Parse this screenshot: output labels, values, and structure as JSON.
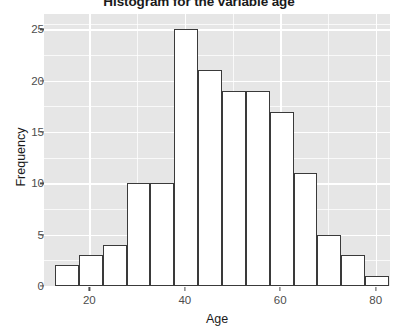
{
  "chart_data": {
    "type": "bar",
    "title": "Histogram for the variable age",
    "xlabel": "Age",
    "ylabel": "Frequency",
    "bin_width": 5,
    "bin_start": 12.8,
    "categories": [
      "12.8-17.8",
      "17.8-22.8",
      "22.8-27.8",
      "27.8-32.8",
      "32.8-37.8",
      "37.8-42.8",
      "42.8-47.8",
      "47.8-52.8",
      "52.8-57.8",
      "57.8-62.8",
      "62.8-67.8",
      "67.8-72.8",
      "72.8-77.8",
      "77.8-82.8"
    ],
    "values": [
      2,
      3,
      4,
      10,
      10,
      25,
      21,
      19,
      19,
      17,
      11,
      5,
      3,
      1
    ],
    "x": [
      12.8,
      17.8,
      22.8,
      27.8,
      32.8,
      37.8,
      42.8,
      47.8,
      52.8,
      57.8,
      62.8,
      67.8,
      72.8,
      77.8
    ],
    "xlim": [
      10.5,
      83
    ],
    "ylim": [
      0,
      26.5
    ],
    "y_ticks": [
      0,
      5,
      10,
      15,
      20,
      25
    ],
    "y_minor_ticks": [
      2.5,
      7.5,
      12.5,
      17.5,
      22.5,
      25.5
    ],
    "x_ticks": [
      20,
      40,
      60,
      80
    ],
    "x_minor_ticks": [
      10,
      30,
      50,
      70
    ],
    "grid": true,
    "legend": "none",
    "panel_color": "#e6e6e6",
    "grid_color": "#ffffff",
    "bar_fill": "#ffffff",
    "bar_outline": "#3a3a3a"
  }
}
